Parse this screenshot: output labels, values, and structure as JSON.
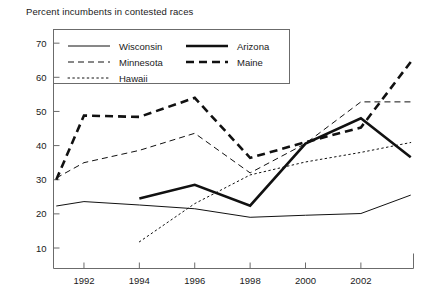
{
  "chart_data": {
    "type": "line",
    "title": "Percent incumbents in contested races",
    "xlabel": "",
    "ylabel": "",
    "xlim": [
      1990.9,
      2003.9
    ],
    "ylim": [
      4,
      74
    ],
    "yticks": [
      10,
      20,
      30,
      40,
      50,
      60,
      70
    ],
    "xticks": [
      1992,
      1994,
      1996,
      1998,
      2000,
      2002
    ],
    "grid": false,
    "legend_position": "top-inside",
    "series": [
      {
        "name": "Wisconsin",
        "style": "thin-solid",
        "x": [
          1991,
          1992,
          1994,
          1996,
          1998,
          2000,
          2002,
          2003.8
        ],
        "values": [
          22.3,
          23.6,
          22.6,
          21.5,
          19.0,
          19.6,
          20.1,
          25.5
        ]
      },
      {
        "name": "Minnesota",
        "style": "thin-dashed",
        "x": [
          1991,
          1992,
          1994,
          1996,
          1998,
          2000,
          2002,
          2003.8
        ],
        "values": [
          30.5,
          35.0,
          38.6,
          43.6,
          32.0,
          40.6,
          52.8,
          52.8
        ]
      },
      {
        "name": "Hawaii",
        "style": "thin-dotted",
        "x": [
          1994,
          1996,
          1998,
          2000,
          2002,
          2003.8
        ],
        "values": [
          11.8,
          23.0,
          31.4,
          35.2,
          38.0,
          40.9
        ]
      },
      {
        "name": "Arizona",
        "style": "thick-solid",
        "x": [
          1994,
          1996,
          1998,
          2000,
          2002,
          2003.8
        ],
        "values": [
          24.5,
          28.5,
          22.4,
          40.6,
          48.0,
          36.6
        ]
      },
      {
        "name": "Maine",
        "style": "thick-dashed",
        "x": [
          1991,
          1992,
          1994,
          1996,
          1998,
          2000,
          2002,
          2003.8
        ],
        "values": [
          30.0,
          48.8,
          48.4,
          54.0,
          36.4,
          41.0,
          45.3,
          64.5
        ]
      }
    ],
    "legend": [
      {
        "label": "Wisconsin",
        "style": "thin-solid"
      },
      {
        "label": "Arizona",
        "style": "thick-solid"
      },
      {
        "label": "Minnesota",
        "style": "thin-dashed"
      },
      {
        "label": "Maine",
        "style": "thick-dashed"
      },
      {
        "label": "Hawaii",
        "style": "thin-dotted"
      }
    ],
    "colors": {
      "ink": "#111111",
      "axis": "#6b6b6b",
      "background": "#ffffff"
    }
  }
}
